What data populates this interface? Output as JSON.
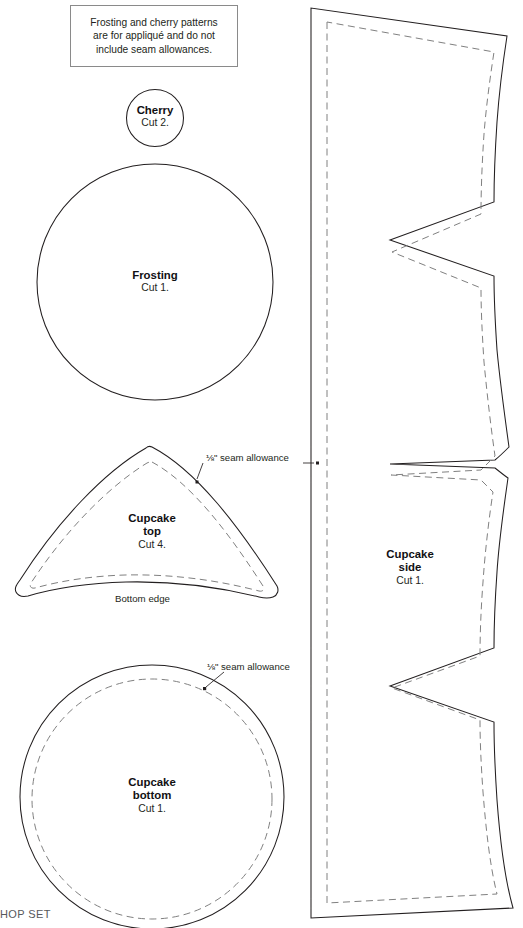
{
  "document": {
    "kind": "sewing-pattern-template",
    "footer_clipped_text": "HOP SET"
  },
  "note": {
    "line1": "Frosting and cherry patterns",
    "line2": "are for appliqué and do not",
    "line3": "include seam allowances."
  },
  "pieces": {
    "cherry": {
      "name": "Cherry",
      "cut": "Cut 2."
    },
    "frosting": {
      "name": "Frosting",
      "cut": "Cut 1."
    },
    "cupcake_top": {
      "name_line1": "Cupcake",
      "name_line2": "top",
      "cut": "Cut 4.",
      "bottom_edge_label": "Bottom edge"
    },
    "cupcake_bottom": {
      "name_line1": "Cupcake",
      "name_line2": "bottom",
      "cut": "Cut 1."
    },
    "cupcake_side": {
      "name_line1": "Cupcake",
      "name_line2": "side",
      "cut": "Cut 1."
    }
  },
  "annotations": {
    "seam_allowance_top": "⅛\" seam allowance",
    "seam_allowance_bottom": "⅛\" seam allowance"
  },
  "colors": {
    "cut_line": "#231f20",
    "seam_line": "#808080",
    "note_border": "#8a8a8a",
    "text": "#231f20",
    "background": "#ffffff"
  }
}
